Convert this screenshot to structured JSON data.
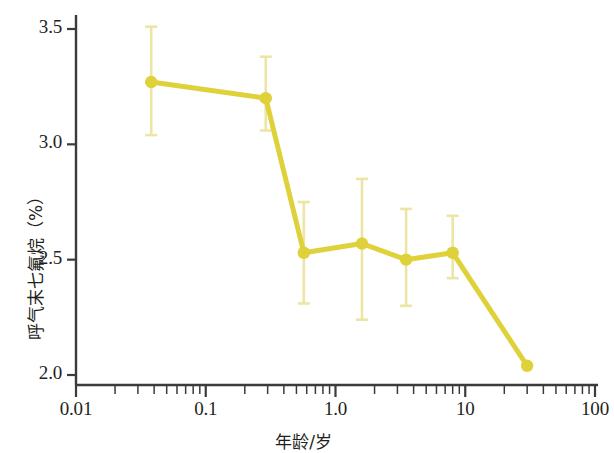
{
  "chart_data": {
    "type": "line",
    "title": "",
    "xlabel": "年龄/岁",
    "ylabel": "呼气末七氟烷（%）",
    "xscale": "log",
    "xlim": [
      0.01,
      100
    ],
    "ylim": [
      2.0,
      3.5
    ],
    "grid": false,
    "legend": "none",
    "xticks": [
      "0.01",
      "0.1",
      "1.0",
      "10",
      "100"
    ],
    "xtick_values": [
      0.01,
      0.1,
      1.0,
      10,
      100
    ],
    "yticks": [
      "2.0",
      "2.5",
      "3.0",
      "3.5"
    ],
    "ytick_values": [
      2.0,
      2.5,
      3.0,
      3.5
    ],
    "series": [
      {
        "name": "呼气末七氟烷浓度",
        "color": "#ded139",
        "errorbar_color": "#ece5a6",
        "marker": "circle",
        "x": [
          0.038,
          0.29,
          0.57,
          1.6,
          3.5,
          8.0,
          30.0
        ],
        "y": [
          3.27,
          3.2,
          2.53,
          2.57,
          2.5,
          2.53,
          2.04
        ],
        "y_upper": [
          3.51,
          3.38,
          2.75,
          2.85,
          2.72,
          2.69,
          null
        ],
        "y_lower": [
          3.04,
          3.06,
          2.31,
          2.24,
          2.3,
          2.42,
          null
        ]
      }
    ]
  },
  "axes": {
    "x_minor_decade_multipliers": [
      2,
      3,
      4,
      5,
      6,
      7,
      8,
      9
    ]
  }
}
